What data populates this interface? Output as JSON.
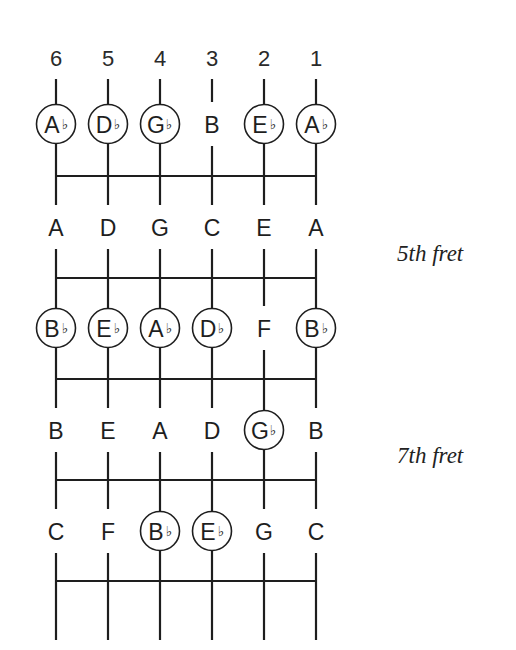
{
  "diagram": {
    "string_numbers": [
      "6",
      "5",
      "4",
      "3",
      "2",
      "1"
    ],
    "colors": {
      "line": "#1e1e1e",
      "text": "#1e1e1e",
      "background": "#ffffff"
    },
    "flat_symbol": "♭",
    "rows": [
      {
        "notes": [
          {
            "letter": "A",
            "flat": true,
            "circled": true
          },
          {
            "letter": "D",
            "flat": true,
            "circled": true
          },
          {
            "letter": "G",
            "flat": true,
            "circled": true
          },
          {
            "letter": "B",
            "flat": false,
            "circled": false
          },
          {
            "letter": "E",
            "flat": true,
            "circled": true
          },
          {
            "letter": "A",
            "flat": true,
            "circled": true
          }
        ]
      },
      {
        "notes": [
          {
            "letter": "A",
            "flat": false,
            "circled": false
          },
          {
            "letter": "D",
            "flat": false,
            "circled": false
          },
          {
            "letter": "G",
            "flat": false,
            "circled": false
          },
          {
            "letter": "C",
            "flat": false,
            "circled": false
          },
          {
            "letter": "E",
            "flat": false,
            "circled": false
          },
          {
            "letter": "A",
            "flat": false,
            "circled": false
          }
        ]
      },
      {
        "notes": [
          {
            "letter": "B",
            "flat": true,
            "circled": true
          },
          {
            "letter": "E",
            "flat": true,
            "circled": true
          },
          {
            "letter": "A",
            "flat": true,
            "circled": true
          },
          {
            "letter": "D",
            "flat": true,
            "circled": true
          },
          {
            "letter": "F",
            "flat": false,
            "circled": false
          },
          {
            "letter": "B",
            "flat": true,
            "circled": true
          }
        ]
      },
      {
        "notes": [
          {
            "letter": "B",
            "flat": false,
            "circled": false
          },
          {
            "letter": "E",
            "flat": false,
            "circled": false
          },
          {
            "letter": "A",
            "flat": false,
            "circled": false
          },
          {
            "letter": "D",
            "flat": false,
            "circled": false
          },
          {
            "letter": "G",
            "flat": true,
            "circled": true
          },
          {
            "letter": "B",
            "flat": false,
            "circled": false
          }
        ]
      },
      {
        "notes": [
          {
            "letter": "C",
            "flat": false,
            "circled": false
          },
          {
            "letter": "F",
            "flat": false,
            "circled": false
          },
          {
            "letter": "B",
            "flat": true,
            "circled": true
          },
          {
            "letter": "E",
            "flat": true,
            "circled": true
          },
          {
            "letter": "G",
            "flat": false,
            "circled": false
          },
          {
            "letter": "C",
            "flat": false,
            "circled": false
          }
        ]
      }
    ],
    "fret_labels": [
      {
        "text": "5th fret",
        "row_between": [
          1,
          2
        ]
      },
      {
        "text": "7th fret",
        "row_between": [
          3,
          4
        ]
      }
    ]
  }
}
